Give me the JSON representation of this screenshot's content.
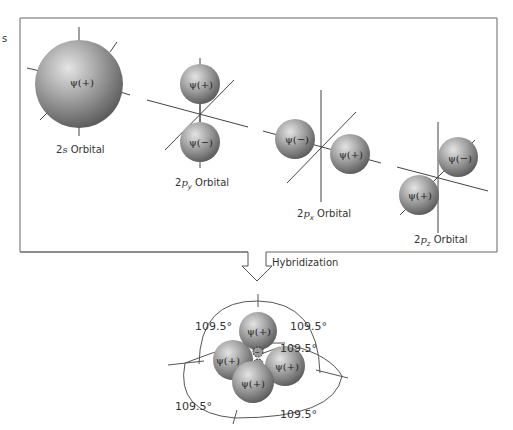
{
  "figure": {
    "orbitals": {
      "s2": {
        "name": "2s Orbital",
        "prefix": "2",
        "italic": "s",
        "suffix": " Orbital",
        "lobes": [
          "ψ(+)"
        ]
      },
      "py": {
        "name": "2p_y Orbital",
        "prefix": "2",
        "italic": "p",
        "sub": "y",
        "suffix": " Orbital",
        "lobes": [
          "ψ(+)",
          "ψ(−)"
        ]
      },
      "px": {
        "name": "2p_x Orbital",
        "prefix": "2",
        "italic": "p",
        "sub": "x",
        "suffix": " Orbital",
        "lobes": [
          "ψ(−)",
          "ψ(+)"
        ]
      },
      "pz": {
        "name": "2p_z Orbital",
        "prefix": "2",
        "italic": "p",
        "sub": "z",
        "suffix": " Orbital",
        "lobes": [
          "ψ(−)",
          "ψ(+)"
        ]
      }
    },
    "arrow_label": "Hybridization",
    "hybrid": {
      "lobes": [
        "ψ(+)",
        "ψ(+)",
        "ψ(+)",
        "ψ(+)"
      ],
      "small_lobe_sign": "−",
      "angles": [
        "109.5°",
        "109.5°",
        "109.5°",
        "109.5°",
        "109.5°"
      ]
    },
    "colors": {
      "sphere_light": "#d8d8d8",
      "sphere_mid": "#9a9a9a",
      "sphere_dark": "#5a5a5a",
      "line": "#444444",
      "frame": "#666666"
    }
  }
}
